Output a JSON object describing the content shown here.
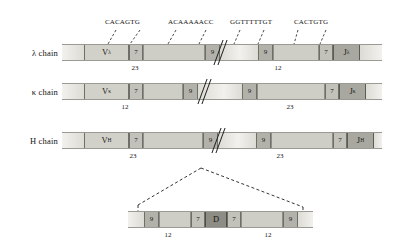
{
  "figure": {
    "sequence_labels": [
      {
        "id": "heptamer-left",
        "text": "CACAGTG"
      },
      {
        "id": "nonamer-left",
        "text": "ACAAAAACC"
      },
      {
        "id": "nonamer-right",
        "text": "GGTTTTTGT"
      },
      {
        "id": "heptamer-right",
        "text": "CACTGTG"
      }
    ],
    "rows": [
      {
        "id": "lambda",
        "label": "λ chain",
        "v_label": "V",
        "v_sub": "λ",
        "j_label": "J",
        "j_sub": "λ",
        "heptamer": "7",
        "nonamer": "9",
        "spacer_left": "23",
        "spacer_right": "12"
      },
      {
        "id": "kappa",
        "label": "κ chain",
        "v_label": "V",
        "v_sub": "κ",
        "j_label": "J",
        "j_sub": "κ",
        "heptamer": "7",
        "nonamer": "9",
        "spacer_left": "12",
        "spacer_right": "23"
      },
      {
        "id": "heavy",
        "label": "H chain",
        "v_label": "V",
        "v_sub": "H",
        "j_label": "J",
        "j_sub": "H",
        "heptamer": "7",
        "nonamer": "9",
        "spacer_left": "23",
        "spacer_right": "23"
      }
    ],
    "d_segment": {
      "d_label": "D",
      "nonamer_left": "9",
      "heptamer_left": "7",
      "heptamer_right": "7",
      "nonamer_right": "9",
      "spacer_left": "12",
      "spacer_right": "12"
    },
    "colors": {
      "v_segment": "#d2d1c9",
      "j_segment": "#a9a8a0",
      "d_segment": "#8d8c85",
      "heptamer": "#c3c2ba",
      "nonamer": "#b3b2aa",
      "spacer": "#cfcec6",
      "line": "#1c1c1c",
      "text": "#121212"
    }
  }
}
